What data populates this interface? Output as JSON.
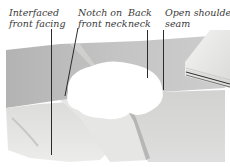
{
  "figure": {
    "labels": [
      {
        "id": "interfaced-front-facing",
        "lines": [
          "Interfaced",
          "front facing"
        ]
      },
      {
        "id": "notch-on-front-neck",
        "lines": [
          "Notch on",
          "front neck"
        ]
      },
      {
        "id": "back-neck",
        "lines": [
          "Back",
          "neck"
        ]
      },
      {
        "id": "open-shoulder-seam",
        "lines": [
          "Open shoulder",
          "seam"
        ]
      }
    ],
    "colors": {
      "background": "#ffffff",
      "fabric_dark": "#b9b9b9",
      "fabric_mid": "#cfcfcf",
      "fabric_light": "#e6e6e4",
      "facing": "#ecebe8",
      "leader_line": "#2b2b2b",
      "label_text": "#3a3a3a"
    }
  }
}
